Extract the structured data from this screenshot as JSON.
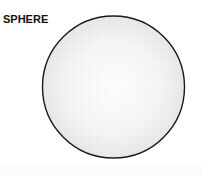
{
  "diagram": {
    "title": "SPHERE",
    "shape": "circle",
    "colors": {
      "outline": "#1a1a1a",
      "fill_center": "#ffffff",
      "fill_edge": "#e6e6e6",
      "text": "#111111"
    }
  }
}
